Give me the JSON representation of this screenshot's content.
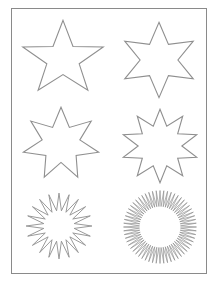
{
  "page": {
    "width": 219,
    "height": 282,
    "background_color": "#ffffff",
    "border_color": "#8a8a8a",
    "line_color": "#8f8f8f"
  },
  "sheet": {
    "border": {
      "x": 11,
      "y": 8,
      "width": 196,
      "height": 266
    },
    "columns": 2,
    "rows": 3
  },
  "shapes": [
    {
      "id": "star-5-point",
      "name": "five-pointed-star",
      "points": 5,
      "cell": {
        "x": 16,
        "y": 16,
        "width": 92,
        "height": 84
      },
      "center": {
        "cx": 50,
        "cy": 50
      },
      "outer_radius": 46,
      "inner_radius": 18.5,
      "rotation_deg": -90,
      "stroke_class": ""
    },
    {
      "id": "star-6-point",
      "name": "six-pointed-star",
      "points": 6,
      "cell": {
        "x": 115,
        "y": 18,
        "width": 86,
        "height": 82
      },
      "center": {
        "cx": 50,
        "cy": 50
      },
      "outer_radius": 46,
      "inner_radius": 22,
      "rotation_deg": -90,
      "stroke_class": ""
    },
    {
      "id": "star-7-point",
      "name": "seven-pointed-star",
      "points": 7,
      "cell": {
        "x": 18,
        "y": 103,
        "width": 84,
        "height": 80
      },
      "center": {
        "cx": 50,
        "cy": 50
      },
      "outer_radius": 46,
      "inner_radius": 23,
      "rotation_deg": -90,
      "stroke_class": ""
    },
    {
      "id": "star-10-point",
      "name": "ten-pointed-star",
      "points": 10,
      "cell": {
        "x": 117,
        "y": 105,
        "width": 84,
        "height": 80
      },
      "center": {
        "cx": 50,
        "cy": 50
      },
      "outer_radius": 46,
      "inner_radius": 26,
      "rotation_deg": -90,
      "stroke_class": ""
    },
    {
      "id": "starburst-20-point",
      "name": "twenty-point-starburst",
      "points": 20,
      "cell": {
        "x": 23,
        "y": 190,
        "width": 70,
        "height": 70
      },
      "center": {
        "cx": 50,
        "cy": 50
      },
      "outer_radius": 47,
      "inner_radius": 22,
      "rotation_deg": -90,
      "stroke_class": "thin"
    },
    {
      "id": "sunburst-60-point",
      "name": "sixty-spike-sunburst",
      "points": 60,
      "cell": {
        "x": 121,
        "y": 188,
        "width": 76,
        "height": 76
      },
      "center": {
        "cx": 50,
        "cy": 50
      },
      "outer_radius": 48,
      "inner_radius": 27,
      "rotation_deg": -90,
      "stroke_class": "hair"
    }
  ]
}
